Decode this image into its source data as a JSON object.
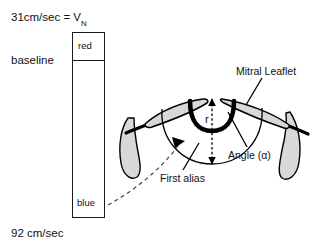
{
  "figure": {
    "type": "pisa-flow-convergence-diagram",
    "title_visible": false
  },
  "legend": {
    "aliasing_velocity_label": "31cm/sec = V",
    "aliasing_velocity_subscript": "N",
    "baseline_label": "baseline",
    "bottom_velocity_label": "92 cm/sec",
    "color_upper_label": "red",
    "color_lower_label": "blue",
    "bar_outline_color": "#1a1a1a",
    "bar_fill_color": "#ffffff"
  },
  "annotations": {
    "mitral_leaflet": "Mitral Leaflet",
    "angle": "Angle (α)",
    "first_alias": "First alias",
    "radius": "r"
  },
  "colors": {
    "leaflet_fill": "#d8d8d8",
    "outline": "#000000",
    "orifice_stroke": "#000000",
    "alias_arc_stroke": "#000000",
    "dashed_line_stroke": "#555555"
  }
}
